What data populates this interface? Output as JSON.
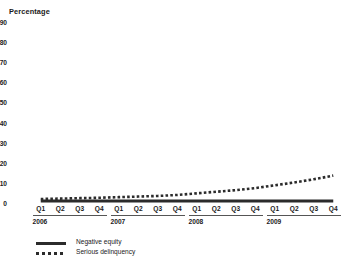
{
  "chart_data": {
    "type": "line",
    "title": "",
    "ylabel": "Percentage",
    "xlabel": "",
    "ylim": [
      0,
      90
    ],
    "yticks": [
      0,
      10,
      20,
      30,
      40,
      50,
      60,
      70,
      80,
      90
    ],
    "grid": false,
    "legend_position": "bottom-left",
    "categories": [
      "Q1",
      "Q2",
      "Q3",
      "Q4",
      "Q1",
      "Q2",
      "Q3",
      "Q4",
      "Q1",
      "Q2",
      "Q3",
      "Q4",
      "Q1",
      "Q2",
      "Q3",
      "Q4"
    ],
    "year_groups": [
      {
        "label": "2006",
        "quarters": [
          "Q1",
          "Q2",
          "Q3",
          "Q4"
        ]
      },
      {
        "label": "2007",
        "quarters": [
          "Q1",
          "Q2",
          "Q3",
          "Q4"
        ]
      },
      {
        "label": "2008",
        "quarters": [
          "Q1",
          "Q2",
          "Q3",
          "Q4"
        ]
      },
      {
        "label": "2009",
        "quarters": [
          "Q1",
          "Q2",
          "Q3",
          "Q4"
        ]
      }
    ],
    "series": [
      {
        "name": "Negative equity",
        "style": "solid",
        "color": "#2b2b2b",
        "values": [
          1,
          1,
          1,
          1,
          1,
          1,
          1,
          1,
          1,
          1,
          1,
          1,
          1,
          1,
          1,
          1
        ]
      },
      {
        "name": "Serious delinquency",
        "style": "dotted",
        "color": "#2b2b2b",
        "values": [
          2.0,
          2.2,
          2.4,
          2.6,
          2.9,
          3.2,
          3.5,
          4.0,
          4.8,
          5.6,
          6.4,
          7.4,
          8.8,
          10.2,
          11.8,
          13.6
        ]
      }
    ]
  },
  "legend": {
    "items": [
      {
        "label": "Negative equity",
        "style": "solid"
      },
      {
        "label": "Serious delinquency",
        "style": "dotted"
      }
    ]
  }
}
